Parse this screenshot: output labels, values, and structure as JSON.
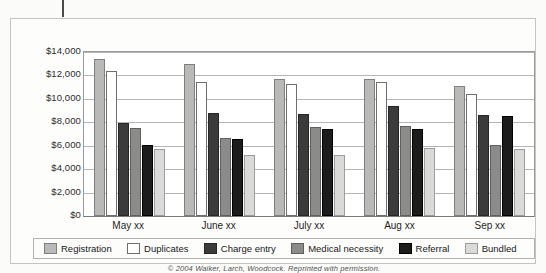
{
  "figure": {
    "copyright": "© 2004 Walker, Larch, Woodcock. Reprinted with permission."
  },
  "chart_data": {
    "type": "bar",
    "title": "",
    "xlabel": "",
    "ylabel": "",
    "ylim": [
      0,
      14000
    ],
    "yticks": [
      0,
      2000,
      4000,
      6000,
      8000,
      10000,
      12000,
      14000
    ],
    "ytick_labels": [
      "$0",
      "$2,000",
      "$4,000",
      "$6,000",
      "$8,000",
      "$10,000",
      "$12,000",
      "$14,000"
    ],
    "grid": true,
    "legend_position": "bottom",
    "categories": [
      "May xx",
      "June xx",
      "July xx",
      "Aug xx",
      "Sep xx"
    ],
    "series": [
      {
        "name": "Registration",
        "color": "#b9b9b7",
        "border": "#7f7f7d",
        "values": [
          13400,
          13000,
          11700,
          11700,
          11100
        ]
      },
      {
        "name": "Duplicates",
        "color": "#ffffff",
        "border": "#6e6e6c",
        "values": [
          12400,
          11400,
          11300,
          11400,
          10400
        ]
      },
      {
        "name": "Charge entry",
        "color": "#3b3b3b",
        "border": "#262626",
        "values": [
          7900,
          8800,
          8700,
          9400,
          8600
        ]
      },
      {
        "name": "Medical necessity",
        "color": "#8b8b89",
        "border": "#5f5f5d",
        "values": [
          7500,
          6700,
          7600,
          7700,
          6100
        ]
      },
      {
        "name": "Referral",
        "color": "#1c1c1c",
        "border": "#000000",
        "values": [
          6100,
          6600,
          7400,
          7400,
          8500
        ]
      },
      {
        "name": "Bundled",
        "color": "#dadad8",
        "border": "#9c9c9a",
        "values": [
          5700,
          5200,
          5200,
          5800,
          5700
        ]
      }
    ]
  }
}
